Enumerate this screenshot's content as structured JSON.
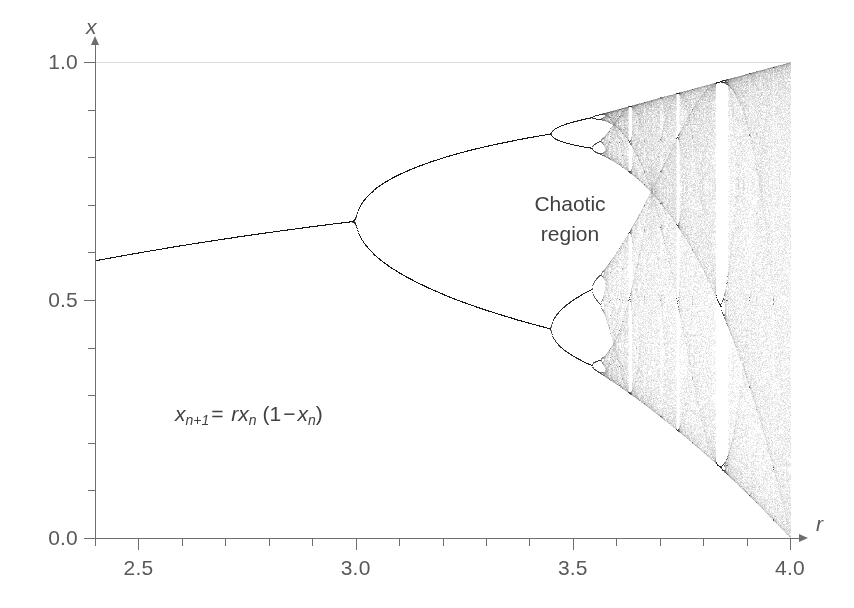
{
  "figure": {
    "background_color": "#ffffff",
    "axis_color": "#6d6e71",
    "text_color": "#58595b",
    "curve_color": "#000000"
  },
  "axes": {
    "x_title": "r",
    "y_title": "x",
    "x_labels": [
      "2.5",
      "3.0",
      "3.5",
      "4.0"
    ],
    "x_label_values": [
      2.5,
      3.0,
      3.5,
      4.0
    ],
    "y_labels": [
      "0.0",
      "0.5",
      "1.0"
    ],
    "y_label_values": [
      0.0,
      0.5,
      1.0
    ],
    "x_minor_step": 0.1,
    "y_minor_step": 0.1
  },
  "annotations": {
    "chaotic_region_line1": "Chaotic",
    "chaotic_region_line2": "region",
    "equation": {
      "lhs_var": "x",
      "lhs_sub": "n+1",
      "equals": "=",
      "rhs_r": "r",
      "rhs_var": "x",
      "rhs_sub": "n",
      "open_paren": "(1",
      "minus": "−",
      "rhs_var2": "x",
      "rhs_sub2": "n",
      "close_paren": ")",
      "plain": "x_{n+1} = r x_n (1 − x_n)"
    }
  },
  "chart_data": {
    "type": "scatter",
    "title": "",
    "subtitle": "",
    "xlabel": "r",
    "ylabel": "x",
    "xlim": [
      2.4,
      4.0
    ],
    "ylim": [
      0.0,
      1.0
    ],
    "grid": false,
    "legend": null,
    "equation": "x_{n+1} = r*x_n*(1 - x_n)",
    "xticks": [
      2.5,
      3.0,
      3.5,
      4.0
    ],
    "xticks_minor": [
      2.4,
      2.6,
      2.7,
      2.8,
      2.9,
      3.1,
      3.2,
      3.3,
      3.4,
      3.6,
      3.7,
      3.8,
      3.9
    ],
    "yticks": [
      0.0,
      0.5,
      1.0
    ],
    "yticks_minor": [
      0.1,
      0.2,
      0.3,
      0.4,
      0.6,
      0.7,
      0.8,
      0.9
    ],
    "annotations": [
      {
        "text": "Chaotic region",
        "x": 3.66,
        "y": 0.72
      },
      {
        "text": "x_{n+1} = r x_n (1 - x_n)",
        "x": 2.82,
        "y": 0.255
      }
    ],
    "render": {
      "r_min": 2.4,
      "r_max": 4.0,
      "r_steps": 1400,
      "transient_iterations": 300,
      "plot_iterations": 260,
      "x0": 0.35,
      "point_alpha": 0.1,
      "point_size": 1
    },
    "key_features": [
      {
        "name": "fixed-point-branch",
        "r_range": [
          2.4,
          3.0
        ],
        "x_formula": "1 - 1/r",
        "x_at_r_min": 0.5833,
        "x_at_r_max": 0.6667
      },
      {
        "name": "period-2-bifurcation",
        "r": 3.0,
        "x": 0.6667
      },
      {
        "name": "period-4-bifurcation",
        "r": 3.449,
        "x_upper": 0.8499,
        "x_lower": 0.44
      },
      {
        "name": "period-8-bifurcation",
        "r": 3.544
      },
      {
        "name": "onset-of-chaos",
        "r": 3.5699
      },
      {
        "name": "period-3-window",
        "r_range": [
          3.828,
          3.857
        ]
      },
      {
        "name": "full-chaos-max",
        "r": 4.0,
        "x_range": [
          0.0,
          1.0
        ]
      }
    ]
  }
}
